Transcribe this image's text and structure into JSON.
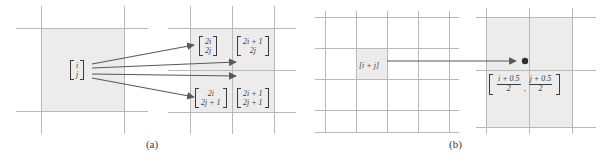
{
  "figure": {
    "type": "diagram",
    "background_color": "#ffffff",
    "grid_line_color": "#b8b8b8",
    "shade_color": "#ececec",
    "ink_color": "#3b3b3b"
  },
  "panels": [
    {
      "id": "a",
      "caption": "(a)",
      "source": {
        "label": "[ i j ]",
        "vector": [
          "i",
          "j"
        ],
        "orientation": "column"
      },
      "targets": [
        {
          "position": "top-left",
          "vector": [
            "2i",
            "2j"
          ],
          "label": "[ 2i 2j ]"
        },
        {
          "position": "top-right",
          "vector": [
            "2i + 1",
            "2j"
          ],
          "label": "[ 2i+1 2j ]"
        },
        {
          "position": "bottom-left",
          "vector": [
            "2i",
            "2j + 1"
          ],
          "label": "[ 2i 2j+1 ]"
        },
        {
          "position": "bottom-right",
          "vector": [
            "2i + 1",
            "2j + 1"
          ],
          "label": "[ 2i+1 2j+1 ]"
        }
      ],
      "arrow_count": 4
    },
    {
      "id": "b",
      "caption": "(b)",
      "source": {
        "label": "[i + j]"
      },
      "target": {
        "numerators": [
          "i + 0.5",
          "j + 0.5"
        ],
        "denominators": [
          "2",
          "2"
        ],
        "separator": ",",
        "label": "[ (i+0.5)/2 , (j+0.5)/2 ]"
      },
      "arrow_count": 1,
      "has_point_marker": true
    }
  ]
}
